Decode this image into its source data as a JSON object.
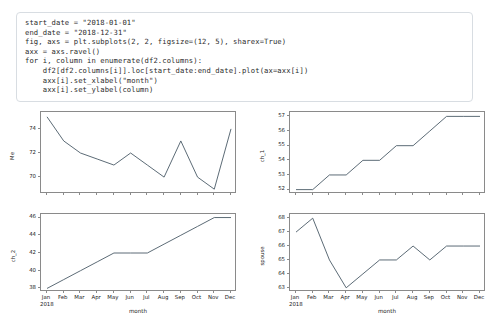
{
  "code": {
    "lines": [
      "start_date = \"2018-01-01\"",
      "end_date = \"2018-12-31\"",
      "fig, axs = plt.subplots(2, 2, figsize=(12, 5), sharex=True)",
      "axx = axs.ravel()",
      "for i, column in enumerate(df2.columns):",
      "    df2[df2.columns[i]].loc[start_date:end_date].plot(ax=axx[i])",
      "    axx[i].set_xlabel(\"month\")",
      "    axx[i].set_ylabel(column)"
    ]
  },
  "figure": {
    "shared_x_categories": [
      "Jan",
      "Feb",
      "Mar",
      "Apr",
      "May",
      "Jun",
      "Jul",
      "Aug",
      "Sep",
      "Oct",
      "Nov",
      "Dec"
    ],
    "x_year_label": "2018",
    "x_axis_label": "month",
    "line_color": "#4a5a66"
  },
  "chart_data": [
    {
      "type": "line",
      "panel": "top-left",
      "title": "",
      "xlabel": "month",
      "ylabel": "Me",
      "categories": [
        "Jan",
        "Feb",
        "Mar",
        "Apr",
        "May",
        "Jun",
        "Jul",
        "Aug",
        "Sep",
        "Oct",
        "Nov",
        "Dec"
      ],
      "values": [
        75,
        73,
        72,
        71.5,
        71,
        72,
        71,
        70,
        73,
        70,
        69,
        74
      ],
      "ylim": [
        68.6,
        75.4
      ],
      "yticks": [
        70,
        72,
        74
      ],
      "grid": false,
      "legend": false
    },
    {
      "type": "line",
      "panel": "top-right",
      "title": "",
      "xlabel": "month",
      "ylabel": "ch_1",
      "categories": [
        "Jan",
        "Feb",
        "Mar",
        "Apr",
        "May",
        "Jun",
        "Jul",
        "Aug",
        "Sep",
        "Oct",
        "Nov",
        "Dec"
      ],
      "values": [
        52,
        52,
        53,
        53,
        54,
        54,
        55,
        55,
        56,
        57,
        57,
        57
      ],
      "ylim": [
        51.7,
        57.3
      ],
      "yticks": [
        52,
        53,
        54,
        55,
        56,
        57
      ],
      "grid": false,
      "legend": false
    },
    {
      "type": "line",
      "panel": "bottom-left",
      "title": "",
      "xlabel": "month",
      "ylabel": "ch_2",
      "categories": [
        "Jan",
        "Feb",
        "Mar",
        "Apr",
        "May",
        "Jun",
        "Jul",
        "Aug",
        "Sep",
        "Oct",
        "Nov",
        "Dec"
      ],
      "values": [
        38,
        39,
        40,
        41,
        42,
        42,
        42,
        43,
        44,
        45,
        46,
        46
      ],
      "ylim": [
        37.6,
        46.4
      ],
      "yticks": [
        38,
        40,
        42,
        44,
        46
      ],
      "grid": false,
      "legend": false
    },
    {
      "type": "line",
      "panel": "bottom-right",
      "title": "",
      "xlabel": "month",
      "ylabel": "spouse",
      "categories": [
        "Jan",
        "Feb",
        "Mar",
        "Apr",
        "May",
        "Jun",
        "Jul",
        "Aug",
        "Sep",
        "Oct",
        "Nov",
        "Dec"
      ],
      "values": [
        67,
        68,
        65,
        63,
        64,
        65,
        65,
        66,
        65,
        66,
        66,
        66
      ],
      "ylim": [
        62.7,
        68.3
      ],
      "yticks": [
        63,
        64,
        65,
        66,
        67,
        68
      ],
      "grid": false,
      "legend": false
    }
  ]
}
